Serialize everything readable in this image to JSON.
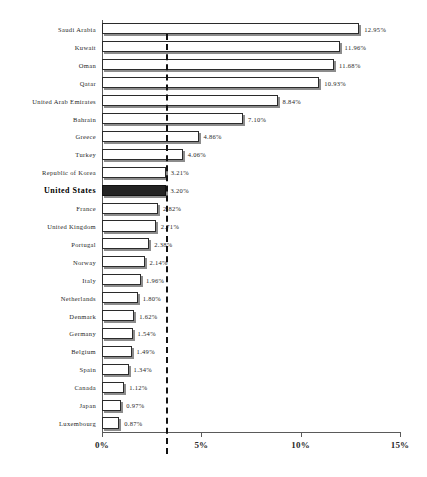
{
  "chart_data": {
    "type": "bar",
    "orientation": "horizontal",
    "title": "",
    "subtitle": "",
    "xlabel": "",
    "ylabel": "",
    "xlim": [
      0,
      15
    ],
    "grid": false,
    "legend": null,
    "axis": {
      "x_ticks": [
        0,
        5,
        10,
        15
      ],
      "x_tick_labels": [
        "0%",
        "5%",
        "10%",
        "15%"
      ]
    },
    "value_suffix": "%",
    "reference_line": {
      "name": "united-states-reference",
      "value": 3.2,
      "style": "dashed",
      "color": "#111111"
    },
    "highlight_category": "United States",
    "colors": {
      "bar_fill": "#ffffff",
      "bar_edge": "#2b2b2b",
      "bar_shadow": "#8c8c8c",
      "highlight_fill": "#232323",
      "axis": "#5a5a5a",
      "text": "#1f1f1f"
    },
    "categories": [
      "Saudi Arabia",
      "Kuwait",
      "Oman",
      "Qatar",
      "United Arab Emirates",
      "Bahrain",
      "Greece",
      "Turkey",
      "Republic of Korea",
      "United States",
      "France",
      "United Kingdom",
      "Portugal",
      "Norway",
      "Italy",
      "Netherlands",
      "Denmark",
      "Germany",
      "Belgium",
      "Spain",
      "Canada",
      "Japan",
      "Luxembourg"
    ],
    "values": [
      12.95,
      11.96,
      11.68,
      10.93,
      8.84,
      7.1,
      4.86,
      4.06,
      3.21,
      3.2,
      2.82,
      2.71,
      2.38,
      2.14,
      1.96,
      1.8,
      1.62,
      1.54,
      1.49,
      1.34,
      1.12,
      0.97,
      0.87
    ],
    "data_labels": [
      "12.95%",
      "11.96%",
      "11.68%",
      "10.93%",
      "8.84%",
      "7.10%",
      "4.86%",
      "4.06%",
      "3.21%",
      "3.20%",
      "2.82%",
      "2.71%",
      "2.38%",
      "2.14%",
      "1.96%",
      "1.80%",
      "1.62%",
      "1.54%",
      "1.49%",
      "1.34%",
      "1.12%",
      "0.97%",
      "0.87%"
    ]
  }
}
